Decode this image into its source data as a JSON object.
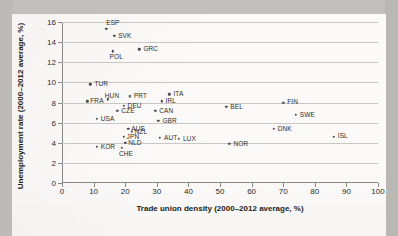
{
  "chart_data": {
    "type": "scatter",
    "title": "",
    "xlabel": "Trade union density (2000–2012 average, %)",
    "ylabel": "Unemployment rate (2000–2012 average, %)",
    "xlim": [
      0,
      100
    ],
    "ylim": [
      0,
      16
    ],
    "xticks": [
      "0",
      "10",
      "20",
      "30",
      "40",
      "50",
      "60",
      "70",
      "80",
      "90",
      "100"
    ],
    "yticks": [
      "0",
      "2",
      "4",
      "6",
      "8",
      "10",
      "12",
      "14",
      "16"
    ],
    "grid": "horizontal",
    "legend": "none",
    "marker_color": "#4a4a4a",
    "grid_color": "#c9c7c4",
    "axis_color": "#8a8886",
    "points": [
      {
        "label": "ESP",
        "x": 14.0,
        "y": 15.3,
        "lx": 0,
        "ly": -10
      },
      {
        "label": "SVK",
        "x": 16.5,
        "y": 14.6,
        "lx": 4,
        "ly": -4
      },
      {
        "label": "GRC",
        "x": 24.5,
        "y": 13.3,
        "lx": 4,
        "ly": -4
      },
      {
        "label": "POL",
        "x": 16.0,
        "y": 13.1,
        "lx": -3,
        "ly": 2
      },
      {
        "label": "TUR",
        "x": 9.0,
        "y": 9.8,
        "lx": 4,
        "ly": -4
      },
      {
        "label": "ITA",
        "x": 34.0,
        "y": 8.8,
        "lx": 4,
        "ly": -4
      },
      {
        "label": "PRT",
        "x": 21.5,
        "y": 8.6,
        "lx": 4,
        "ly": -4
      },
      {
        "label": "HUN",
        "x": 14.5,
        "y": 8.3,
        "lx": -3,
        "ly": -7
      },
      {
        "label": "IRL",
        "x": 31.5,
        "y": 8.1,
        "lx": 4,
        "ly": -4
      },
      {
        "label": "FRA",
        "x": 8.0,
        "y": 8.1,
        "lx": 3,
        "ly": -4
      },
      {
        "label": "FIN",
        "x": 70.0,
        "y": 8.0,
        "lx": 4,
        "ly": -5
      },
      {
        "label": "DEU",
        "x": 19.5,
        "y": 7.7,
        "lx": 4,
        "ly": -4
      },
      {
        "label": "BEL",
        "x": 52.0,
        "y": 7.6,
        "lx": 4,
        "ly": -4
      },
      {
        "label": "CZE",
        "x": 17.5,
        "y": 7.2,
        "lx": 4,
        "ly": -4
      },
      {
        "label": "CAN",
        "x": 29.5,
        "y": 7.2,
        "lx": 4,
        "ly": -4
      },
      {
        "label": "SWE",
        "x": 74.0,
        "y": 6.8,
        "lx": 4,
        "ly": -4
      },
      {
        "label": "USA",
        "x": 11.0,
        "y": 6.4,
        "lx": 4,
        "ly": -4
      },
      {
        "label": "GBR",
        "x": 30.5,
        "y": 6.2,
        "lx": 4,
        "ly": -4
      },
      {
        "label": "DNK",
        "x": 67.0,
        "y": 5.4,
        "lx": 4,
        "ly": -4
      },
      {
        "label": "AUS",
        "x": 21.0,
        "y": 5.4,
        "lx": 3,
        "ly": -4
      },
      {
        "label": "NZL",
        "x": 22.0,
        "y": 5.1,
        "lx": 3,
        "ly": -4
      },
      {
        "label": "ISL",
        "x": 86.0,
        "y": 4.6,
        "lx": 4,
        "ly": -5
      },
      {
        "label": "JPN",
        "x": 19.5,
        "y": 4.6,
        "lx": 3,
        "ly": -4
      },
      {
        "label": "AUT",
        "x": 31.0,
        "y": 4.5,
        "lx": 4,
        "ly": -4
      },
      {
        "label": "LUX",
        "x": 37.0,
        "y": 4.4,
        "lx": 4,
        "ly": -4
      },
      {
        "label": "NOR",
        "x": 53.0,
        "y": 3.9,
        "lx": 4,
        "ly": -4
      },
      {
        "label": "NLD",
        "x": 20.0,
        "y": 4.0,
        "lx": 3,
        "ly": -4
      },
      {
        "label": "CHE",
        "x": 19.0,
        "y": 3.5,
        "lx": -3,
        "ly": 2
      },
      {
        "label": "KOR",
        "x": 11.0,
        "y": 3.6,
        "lx": 4,
        "ly": -4
      }
    ]
  }
}
